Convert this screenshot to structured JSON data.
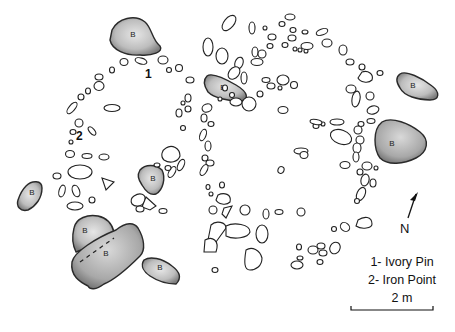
{
  "figure": {
    "type": "archaeological site plan",
    "boulder_label": "B",
    "boulder_count": 9,
    "find_markers": [
      {
        "id": "1",
        "x": 148,
        "y": 74
      },
      {
        "id": "2",
        "x": 80,
        "y": 138
      }
    ]
  },
  "legend": {
    "items": [
      {
        "label": "1- Ivory Pin"
      },
      {
        "label": "2- Iron Point"
      }
    ],
    "scale_label": "2 m"
  },
  "north_arrow": {
    "label": "N"
  },
  "colors": {
    "background": "#ffffff",
    "stone_outline": "#222222",
    "boulder_fill_light": "#dedede",
    "boulder_fill_dark": "#8a8a8a"
  }
}
